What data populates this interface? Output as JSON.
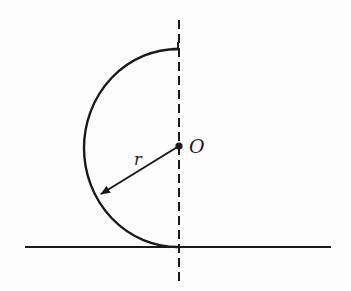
{
  "diagram": {
    "labels": {
      "center": "O",
      "radius": "r"
    },
    "colors": {
      "stroke": "#1a1a1a",
      "background": "#fdfdfd"
    },
    "geometry": {
      "center": [
        179,
        146
      ],
      "arc_top": [
        178,
        49
      ],
      "arc_bottom": [
        178,
        247
      ],
      "arc_leftmost": [
        85,
        146
      ],
      "ground_line": {
        "x1": 25,
        "x2": 331,
        "y": 247
      },
      "axis_line": {
        "x": 179,
        "y1": 20,
        "y2": 283,
        "style": "dashed"
      },
      "radius_arrow": {
        "from": [
          179,
          146
        ],
        "to": [
          100,
          195
        ]
      }
    }
  }
}
